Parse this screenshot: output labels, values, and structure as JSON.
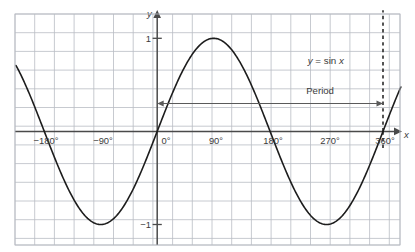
{
  "figure": {
    "name": "sine-function-graph",
    "curve_label": "y = sin x",
    "curve_label_parts": {
      "y": "y",
      "equals": " = sin ",
      "x": "x"
    },
    "period_label": "Period",
    "axis_labels": {
      "x": "x",
      "y": "y"
    },
    "colors": {
      "grid": "#b9bcc4",
      "axis": "#4a4a4a",
      "curve": "#1d1d1d",
      "period": "#5a5a5a",
      "background": "#ffffff",
      "text": "#3b3b3b"
    }
  },
  "chart_data": {
    "type": "line",
    "title": "",
    "subtitle": "",
    "xlabel": "x",
    "ylabel": "y",
    "function": "y = sin x",
    "xlim": [
      -225,
      405
    ],
    "ylim": [
      -1.6,
      1.6
    ],
    "grid": true,
    "grid_spacing_x_deg": 30,
    "grid_spacing_y": 0.4,
    "legend": "none",
    "x_tick_labels": [
      "−180°",
      "−90°",
      "0°",
      "90°",
      "180°",
      "270°",
      "360°"
    ],
    "x_tick_values": [
      -180,
      -90,
      0,
      90,
      180,
      270,
      360
    ],
    "y_tick_labels": [
      "1",
      "−1"
    ],
    "y_tick_values": [
      1,
      -1
    ],
    "annotations": [
      {
        "text": "y = sin x",
        "x_deg": 240,
        "y": 0.72
      },
      {
        "text": "Period",
        "x_deg": 270,
        "y": 0.3,
        "type": "span-arrow",
        "span_from_deg": 0,
        "span_to_deg": 360
      }
    ],
    "markers": [
      {
        "type": "vertical-dashed-line",
        "x_deg": 360,
        "from_y": -0.2,
        "to_y": 1.3
      }
    ],
    "series": [
      {
        "name": "y = sin x",
        "x": [
          -225,
          -210,
          -195,
          -180,
          -165,
          -150,
          -135,
          -120,
          -105,
          -90,
          -75,
          -60,
          -45,
          -30,
          -15,
          0,
          15,
          30,
          45,
          60,
          75,
          90,
          105,
          120,
          135,
          150,
          165,
          180,
          195,
          210,
          225,
          240,
          255,
          270,
          285,
          300,
          315,
          330,
          345,
          360,
          375,
          390,
          405
        ],
        "y": [
          0.707,
          0.5,
          0.259,
          0,
          -0.259,
          -0.5,
          -0.707,
          -0.866,
          -0.966,
          -1,
          -0.966,
          -0.866,
          -0.707,
          -0.5,
          -0.259,
          0,
          0.259,
          0.5,
          0.707,
          0.866,
          0.966,
          1,
          0.966,
          0.866,
          0.707,
          0.5,
          0.259,
          0,
          -0.259,
          -0.5,
          -0.707,
          -0.866,
          -0.966,
          -1,
          -0.966,
          -0.866,
          -0.707,
          -0.5,
          -0.259,
          0,
          0.259,
          0.5,
          0.707
        ]
      }
    ]
  }
}
